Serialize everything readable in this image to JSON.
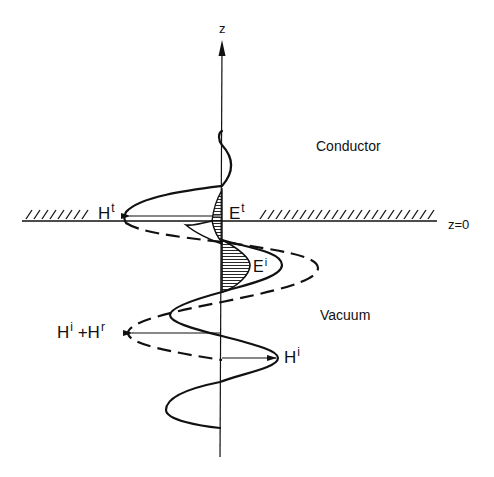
{
  "figure": {
    "axis_label": "z",
    "surface_label": "z=0",
    "regions": {
      "upper": "Conductor",
      "lower": "Vacuum"
    },
    "fields": {
      "transmitted_h": {
        "base": "H",
        "sup": "t"
      },
      "transmitted_e": {
        "base": "E",
        "sup": "t"
      },
      "incident_e": {
        "base": "E",
        "sup": "i"
      },
      "incident_h": {
        "base": "H",
        "sup": "i"
      },
      "total_h_base1": "H",
      "total_h_sup1": "i",
      "total_h_plus": " +",
      "total_h_base2": "H",
      "total_h_sup2": "r"
    },
    "colors": {
      "ink": "#111111",
      "background": "#ffffff"
    }
  }
}
